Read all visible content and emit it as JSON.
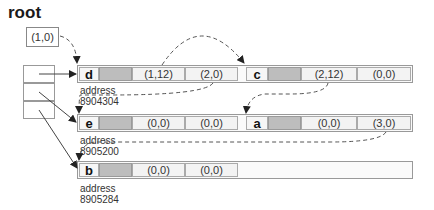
{
  "diagram": {
    "root": {
      "label": "root",
      "value": "(1,0)"
    },
    "hash_table": {
      "cells": 3
    },
    "rows": [
      {
        "nodes": [
          {
            "key": "d",
            "fields": [
              "(1,12)",
              "(2,0)"
            ]
          },
          {
            "key": "c",
            "fields": [
              "(2,12)",
              "(0,0)"
            ]
          }
        ],
        "address_label": "address",
        "address": "8904304"
      },
      {
        "nodes": [
          {
            "key": "e",
            "fields": [
              "(0,0)",
              "(0,0)"
            ]
          },
          {
            "key": "a",
            "fields": [
              "(0,0)",
              "(3,0)"
            ]
          }
        ],
        "address_label": "address",
        "address": "8905200"
      },
      {
        "nodes": [
          {
            "key": "b",
            "fields": [
              "(0,0)",
              "(0,0)"
            ]
          }
        ],
        "address_label": "address",
        "address": "8905284"
      }
    ],
    "colors": {
      "grey_cell": "#bdbdbd",
      "border": "#999999",
      "arrow": "#333333",
      "dashed": "#666666"
    }
  }
}
